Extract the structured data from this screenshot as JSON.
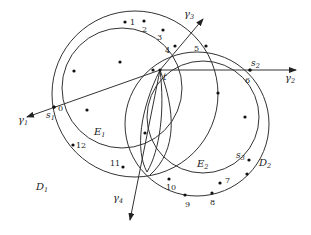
{
  "diagram": {
    "stroke": "#333333",
    "circles": [
      {
        "name": "D1",
        "cx": 135,
        "cy": 94,
        "r": 83,
        "label": "D",
        "sub": "1",
        "lx": 36,
        "ly": 190
      },
      {
        "name": "E1",
        "cx": 122,
        "cy": 88,
        "r": 60,
        "label": "E",
        "sub": "1",
        "lx": 94,
        "ly": 135
      },
      {
        "name": "D2",
        "cx": 197,
        "cy": 124,
        "r": 72,
        "label": "D",
        "sub": "2",
        "lx": 259,
        "ly": 166
      },
      {
        "name": "E2",
        "cx": 203,
        "cy": 117,
        "r": 56,
        "label": "E",
        "sub": "2",
        "lx": 197,
        "ly": 167
      }
    ],
    "lenses": [
      {
        "name": "lens-left",
        "path": "M160,70 C140,110 135,150 147,172 C160,150 165,110 160,70"
      },
      {
        "name": "lens-right",
        "path": "M160,70 C175,110 178,150 150,175"
      }
    ],
    "rays": [
      {
        "name": "gamma1",
        "x1": 160,
        "y1": 70,
        "x2": 27,
        "y2": 117,
        "label": "γ",
        "sub": "1",
        "lx": 18,
        "ly": 123
      },
      {
        "name": "gamma2",
        "x1": 160,
        "y1": 70,
        "x2": 296,
        "y2": 70,
        "label": "γ",
        "sub": "2",
        "lx": 285,
        "ly": 81
      },
      {
        "name": "gamma3",
        "x1": 160,
        "y1": 70,
        "x2": 203,
        "y2": 19,
        "label": "γ",
        "sub": "3",
        "lx": 184,
        "ly": 17
      },
      {
        "name": "gamma4",
        "x1": 160,
        "y1": 70,
        "x2": 130,
        "y2": 220,
        "label": "γ",
        "sub": "4",
        "lx": 113,
        "ly": 201
      }
    ],
    "special_points": [
      {
        "name": "t",
        "x": 160,
        "y": 70,
        "label": "t",
        "lx": 163,
        "ly": 80
      },
      {
        "name": "s1",
        "x": 54,
        "y": 107,
        "label": "s",
        "sub": "1",
        "lx": 46,
        "ly": 118
      },
      {
        "name": "s2",
        "x": 250,
        "y": 70,
        "label": "s",
        "sub": "2",
        "lx": 251,
        "ly": 66
      },
      {
        "name": "s3",
        "x": 249,
        "y": 160,
        "label": "s",
        "sub": "3",
        "lx": 236,
        "ly": 158
      }
    ],
    "numbered_points": [
      {
        "n": "0",
        "x": 54,
        "y": 107,
        "lx": 58,
        "ly": 111
      },
      {
        "n": "1",
        "x": 125,
        "y": 22,
        "lx": 130,
        "ly": 25
      },
      {
        "n": "2",
        "x": 144,
        "y": 21,
        "lx": 142,
        "ly": 32
      },
      {
        "n": "3",
        "x": 163,
        "y": 30,
        "lx": 157,
        "ly": 40
      },
      {
        "n": "4",
        "x": 175,
        "y": 46,
        "lx": 165,
        "ly": 53
      },
      {
        "n": "5",
        "x": 206,
        "y": 46,
        "lx": 194,
        "ly": 51
      },
      {
        "n": "6",
        "x": 250,
        "y": 70,
        "lx": 245,
        "ly": 83
      },
      {
        "n": "7",
        "x": 220,
        "y": 183,
        "lx": 225,
        "ly": 183
      },
      {
        "n": "8",
        "x": 212,
        "y": 193,
        "lx": 210,
        "ly": 205
      },
      {
        "n": "9",
        "x": 185,
        "y": 195,
        "lx": 185,
        "ly": 207
      },
      {
        "n": "10",
        "x": 169,
        "y": 179,
        "lx": 166,
        "ly": 190
      },
      {
        "n": "11",
        "x": 123,
        "y": 167,
        "lx": 110,
        "ly": 166
      },
      {
        "n": "12",
        "x": 73,
        "y": 145,
        "lx": 76,
        "ly": 148
      }
    ],
    "interior_points": [
      {
        "x": 74,
        "y": 71
      },
      {
        "x": 120,
        "y": 62
      },
      {
        "x": 153,
        "y": 70
      },
      {
        "x": 87,
        "y": 110
      },
      {
        "x": 218,
        "y": 93
      },
      {
        "x": 245,
        "y": 117
      },
      {
        "x": 247,
        "y": 174
      },
      {
        "x": 145,
        "y": 133
      }
    ]
  }
}
